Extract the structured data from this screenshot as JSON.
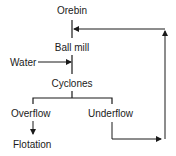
{
  "diagram": {
    "type": "process-flow",
    "nodes": {
      "orebin": "Orebin",
      "ball_mill": "Ball mill",
      "water": "Water",
      "cyclones": "Cyclones",
      "overflow": "Overflow",
      "underflow": "Underflow",
      "flotation": "Flotation"
    },
    "edges": [
      {
        "from": "Orebin",
        "to": "Ball mill"
      },
      {
        "from": "Water",
        "to": "Ball mill"
      },
      {
        "from": "Ball mill",
        "to": "Cyclones"
      },
      {
        "from": "Cyclones",
        "to": "Overflow"
      },
      {
        "from": "Cyclones",
        "to": "Underflow"
      },
      {
        "from": "Overflow",
        "to": "Flotation"
      },
      {
        "from": "Underflow",
        "to": "Ball mill"
      }
    ],
    "colors": {
      "line": "#1a1a1a",
      "background": "#ffffff"
    }
  }
}
